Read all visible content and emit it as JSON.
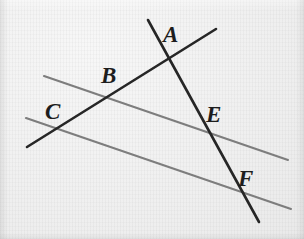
{
  "figure": {
    "kind": "geometry-line-diagram",
    "width": 304,
    "height": 239,
    "background_color": "#f1f1f1",
    "description_labels": [
      "A",
      "B",
      "C",
      "E",
      "F"
    ],
    "line_color_dark": "#262626",
    "line_color_gray": "#7d7d7d",
    "label_color": "#1d1d1d"
  },
  "lines": [
    {
      "id": "transversal-upper-gray",
      "name": "upper-gray-line",
      "color": "#7d7d7d",
      "stroke_width": 2.1,
      "x1": 44,
      "y1": 76,
      "x2": 288,
      "y2": 160
    },
    {
      "id": "transversal-lower-gray",
      "name": "lower-gray-line",
      "color": "#7d7d7d",
      "stroke_width": 2.1,
      "x1": 26,
      "y1": 118,
      "x2": 291,
      "y2": 209
    },
    {
      "id": "rising-dark",
      "name": "dark-rising-line",
      "color": "#262626",
      "stroke_width": 2.6,
      "x1": 27,
      "y1": 147,
      "x2": 216,
      "y2": 29
    },
    {
      "id": "steep-dark",
      "name": "dark-steep-line",
      "color": "#262626",
      "stroke_width": 2.6,
      "x1": 148,
      "y1": 20,
      "x2": 259,
      "y2": 222
    }
  ],
  "labels": [
    {
      "id": "A",
      "text": "A",
      "x": 163,
      "y": 23,
      "font_size": 23
    },
    {
      "id": "B",
      "text": "B",
      "x": 101,
      "y": 64,
      "font_size": 23
    },
    {
      "id": "C",
      "text": "C",
      "x": 45,
      "y": 100,
      "font_size": 23
    },
    {
      "id": "E",
      "text": "E",
      "x": 206,
      "y": 103,
      "font_size": 23
    },
    {
      "id": "F",
      "text": "F",
      "x": 238,
      "y": 167,
      "font_size": 23
    }
  ]
}
